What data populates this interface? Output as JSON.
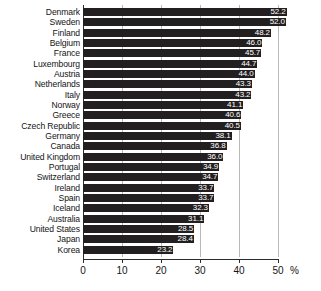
{
  "chart_data": {
    "type": "bar",
    "orientation": "horizontal",
    "title": "",
    "xlabel": "%",
    "ylabel": "",
    "xlim": [
      0,
      50
    ],
    "xticks": [
      0,
      10,
      20,
      30,
      40,
      50
    ],
    "xtick_labels": [
      "0",
      "10",
      "20",
      "30",
      "40",
      "50"
    ],
    "grid": true,
    "legend": null,
    "bar_color": "#231f20",
    "value_label_color": "#ffffff",
    "categories": [
      "Denmark",
      "Sweden",
      "Finland",
      "Belgium",
      "France",
      "Luxembourg",
      "Austria",
      "Netherlands",
      "Italy",
      "Norway",
      "Greece",
      "Czech Republic",
      "Germany",
      "Canada",
      "United Kingdom",
      "Portugal",
      "Switzerland",
      "Ireland",
      "Spain",
      "Iceland",
      "Australia",
      "United States",
      "Japan",
      "Korea"
    ],
    "values": [
      52.2,
      52.0,
      48.2,
      46.0,
      45.7,
      44.7,
      44.0,
      43.3,
      43.2,
      41.1,
      40.6,
      40.5,
      38.1,
      36.8,
      36.0,
      34.9,
      34.7,
      33.7,
      33.7,
      32.3,
      31.1,
      28.5,
      28.4,
      23.2
    ],
    "value_labels": [
      "52.2",
      "52.0",
      "48.2",
      "46.0",
      "45.7",
      "44.7",
      "44.0",
      "43.3",
      "43.2",
      "41.1",
      "40.6",
      "40.5",
      "38.1",
      "36.8",
      "36.0",
      "34.9",
      "34.7",
      "33.7",
      "33.7",
      "32.3",
      "31.1",
      "28.5",
      "28.4",
      "23.2"
    ]
  }
}
